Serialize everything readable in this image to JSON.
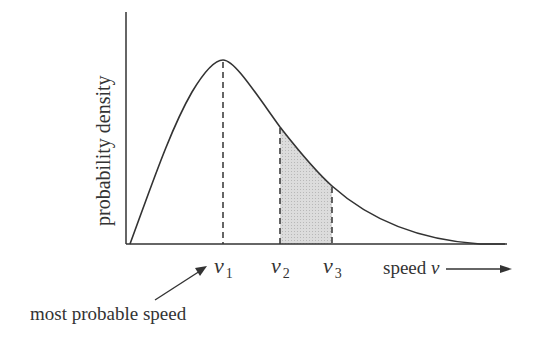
{
  "diagram": {
    "type": "speed-distribution",
    "ylabel": "probability density",
    "xlabel": "speed",
    "xlabel_symbol": "v",
    "markers": [
      {
        "symbol": "v",
        "subscript": "1",
        "role": "peak"
      },
      {
        "symbol": "v",
        "subscript": "2",
        "role": "shaded-start"
      },
      {
        "symbol": "v",
        "subscript": "3",
        "role": "shaded-end"
      }
    ],
    "annotation": "most probable speed",
    "colors": {
      "line": "#333333",
      "shade": "#d4d4d4"
    }
  }
}
